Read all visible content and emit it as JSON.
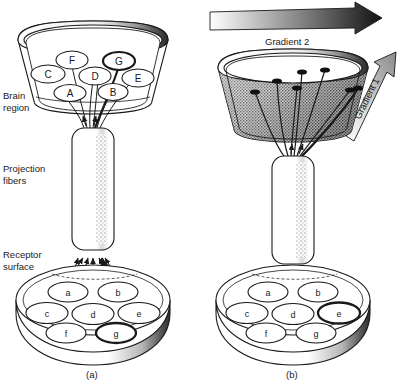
{
  "figure": {
    "background": "#ffffff",
    "ink": "#1a1a1a",
    "description_labels": {
      "brain_region_line1": "Brain",
      "brain_region_line2": "region",
      "projection_line1": "Projection",
      "projection_line2": "fibers",
      "receptor_line1": "Receptor",
      "receptor_line2": "surface"
    }
  },
  "panels": [
    {
      "id": "a",
      "caption": "(a)",
      "brain_region": {
        "style": "outlined-ellipses",
        "nodes": [
          {
            "label": "C",
            "x": 48,
            "y": 74,
            "rx": 17,
            "ry": 9,
            "highlight": false
          },
          {
            "label": "F",
            "x": 72,
            "y": 60,
            "rx": 16,
            "ry": 9,
            "highlight": false
          },
          {
            "label": "A",
            "x": 70,
            "y": 93,
            "rx": 16,
            "ry": 8.5,
            "highlight": false
          },
          {
            "label": "D",
            "x": 95,
            "y": 76,
            "rx": 16,
            "ry": 9,
            "highlight": false
          },
          {
            "label": "G",
            "x": 119,
            "y": 61,
            "rx": 16,
            "ry": 9,
            "highlight": true
          },
          {
            "label": "B",
            "x": 113,
            "y": 92,
            "rx": 15,
            "ry": 8.5,
            "highlight": false
          },
          {
            "label": "E",
            "x": 138,
            "y": 78,
            "rx": 16,
            "ry": 9,
            "highlight": false
          }
        ]
      },
      "receptor_surface": {
        "nodes": [
          {
            "label": "a",
            "x": 68,
            "y": 292,
            "rx": 20,
            "ry": 10,
            "highlight": false
          },
          {
            "label": "b",
            "x": 118,
            "y": 292,
            "rx": 20,
            "ry": 10,
            "highlight": false
          },
          {
            "label": "c",
            "x": 47,
            "y": 313,
            "rx": 21,
            "ry": 10.5,
            "highlight": false
          },
          {
            "label": "d",
            "x": 93,
            "y": 314,
            "rx": 21,
            "ry": 10.5,
            "highlight": false
          },
          {
            "label": "e",
            "x": 139,
            "y": 313,
            "rx": 21,
            "ry": 10.5,
            "highlight": false
          },
          {
            "label": "f",
            "x": 66,
            "y": 333,
            "rx": 20,
            "ry": 10,
            "highlight": false
          },
          {
            "label": "g",
            "x": 116,
            "y": 333,
            "rx": 20,
            "ry": 10,
            "highlight": true
          }
        ]
      }
    },
    {
      "id": "b",
      "caption": "(b)",
      "brain_region": {
        "style": "stippled-gradient-shading",
        "terminal_dots": [
          {
            "x": 255,
            "y": 92
          },
          {
            "x": 277,
            "y": 81
          },
          {
            "x": 297,
            "y": 88
          },
          {
            "x": 302,
            "y": 72
          },
          {
            "x": 325,
            "y": 70
          },
          {
            "x": 350,
            "y": 90
          },
          {
            "x": 268,
            "y": 69
          }
        ]
      },
      "receptor_surface": {
        "nodes": [
          {
            "label": "a",
            "x": 268,
            "y": 292,
            "rx": 20,
            "ry": 10,
            "highlight": false
          },
          {
            "label": "b",
            "x": 318,
            "y": 292,
            "rx": 20,
            "ry": 10,
            "highlight": false
          },
          {
            "label": "c",
            "x": 247,
            "y": 313,
            "rx": 21,
            "ry": 10.5,
            "highlight": false
          },
          {
            "label": "d",
            "x": 293,
            "y": 314,
            "rx": 21,
            "ry": 10.5,
            "highlight": false
          },
          {
            "label": "e",
            "x": 339,
            "y": 313,
            "rx": 21,
            "ry": 10.5,
            "highlight": true
          },
          {
            "label": "f",
            "x": 266,
            "y": 333,
            "rx": 20,
            "ry": 10,
            "highlight": false
          },
          {
            "label": "g",
            "x": 316,
            "y": 333,
            "rx": 20,
            "ry": 10,
            "highlight": false
          }
        ]
      },
      "gradients": [
        {
          "label": "Gradient 2",
          "direction": "horizontal-right",
          "shading": "light-to-dark"
        },
        {
          "label": "Gradient 1",
          "direction": "diagonal-up-right",
          "shading": "light-to-dark"
        }
      ]
    }
  ]
}
